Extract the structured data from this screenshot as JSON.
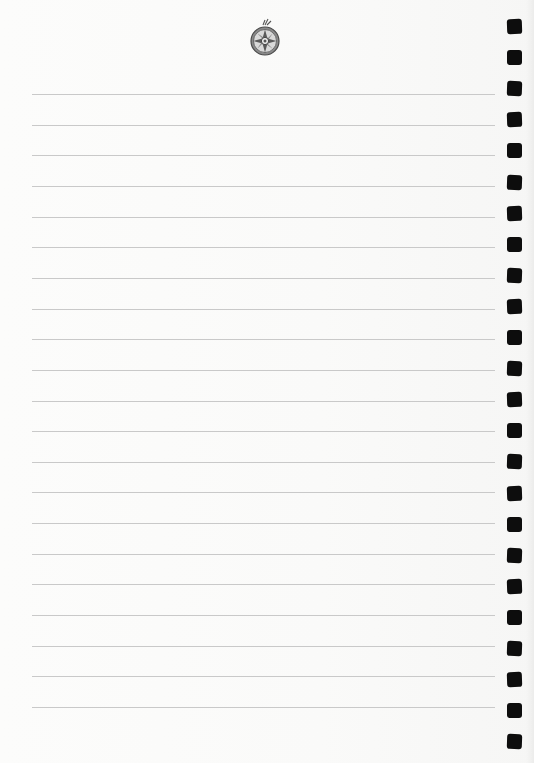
{
  "page": {
    "type": "ruled-notebook-page",
    "background_color": "#fbfbfa",
    "line_color": "#c9c9c9",
    "hole_color": "#0d0d0d",
    "ornament": {
      "name": "compass-rose-ornament",
      "center_x": 265,
      "center_y": 41
    },
    "rules": {
      "count": 21,
      "start_y": 94,
      "spacing": 30.65,
      "x_start": 32,
      "x_end": 495
    },
    "binding_holes": {
      "count": 24,
      "start_y": 19,
      "spacing": 31.1,
      "x": 507,
      "size": 15
    }
  }
}
